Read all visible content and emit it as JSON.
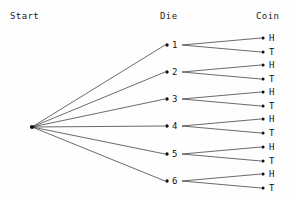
{
  "diagram": {
    "type": "probability-tree",
    "title": "",
    "columns": [
      {
        "id": "start",
        "label": "Start"
      },
      {
        "id": "die",
        "label": "Die"
      },
      {
        "id": "coin",
        "label": "Coin"
      }
    ],
    "root": {
      "id": "root",
      "label": "",
      "x": 32,
      "y": 127
    },
    "die_nodes": [
      {
        "id": "die-1",
        "label": "1",
        "x": 167,
        "y": 45
      },
      {
        "id": "die-2",
        "label": "2",
        "x": 167,
        "y": 72
      },
      {
        "id": "die-3",
        "label": "3",
        "x": 167,
        "y": 99
      },
      {
        "id": "die-4",
        "label": "4",
        "x": 167,
        "y": 126
      },
      {
        "id": "die-5",
        "label": "5",
        "x": 167,
        "y": 154
      },
      {
        "id": "die-6",
        "label": "6",
        "x": 167,
        "y": 181
      }
    ],
    "coin_nodes": [
      {
        "id": "coin-1-H",
        "parent": "die-1",
        "label": "H",
        "x": 263,
        "y": 38
      },
      {
        "id": "coin-1-T",
        "parent": "die-1",
        "label": "T",
        "x": 263,
        "y": 52
      },
      {
        "id": "coin-2-H",
        "parent": "die-2",
        "label": "H",
        "x": 263,
        "y": 65
      },
      {
        "id": "coin-2-T",
        "parent": "die-2",
        "label": "T",
        "x": 263,
        "y": 79
      },
      {
        "id": "coin-3-H",
        "parent": "die-3",
        "label": "H",
        "x": 263,
        "y": 92
      },
      {
        "id": "coin-3-T",
        "parent": "die-3",
        "label": "T",
        "x": 263,
        "y": 106
      },
      {
        "id": "coin-4-H",
        "parent": "die-4",
        "label": "H",
        "x": 263,
        "y": 119
      },
      {
        "id": "coin-4-T",
        "parent": "die-4",
        "label": "T",
        "x": 263,
        "y": 133
      },
      {
        "id": "coin-5-H",
        "parent": "die-5",
        "label": "H",
        "x": 263,
        "y": 147
      },
      {
        "id": "coin-5-T",
        "parent": "die-5",
        "label": "T",
        "x": 263,
        "y": 161
      },
      {
        "id": "coin-6-H",
        "parent": "die-6",
        "label": "H",
        "x": 263,
        "y": 174
      },
      {
        "id": "coin-6-T",
        "parent": "die-6",
        "label": "T",
        "x": 263,
        "y": 188
      }
    ],
    "colors": {
      "background": "#fefefe",
      "line": "#2b2b2b",
      "node": "#111111",
      "text": "#111111"
    },
    "counts": {
      "die_outcomes": 6,
      "coin_outcomes_per_die": 2,
      "total_leaves": 12
    }
  }
}
